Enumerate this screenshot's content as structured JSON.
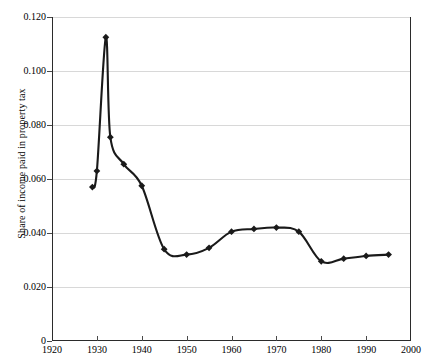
{
  "chart_data": {
    "type": "line",
    "title": "",
    "xlabel": "",
    "ylabel": "Share of income paid in property tax",
    "xlim": [
      1920,
      2000
    ],
    "ylim": [
      0,
      0.12
    ],
    "grid": true,
    "legend": "none",
    "marker": "diamond",
    "line_color": "#1a1a1a",
    "grid_color": "#d8d8d8",
    "axis_color": "#2b2b2b",
    "xticks": [
      1920,
      1930,
      1940,
      1950,
      1960,
      1970,
      1980,
      1990,
      2000
    ],
    "xtick_labels": [
      "1920",
      "1930",
      "1940",
      "1950",
      "1960",
      "1970",
      "1980",
      "1990",
      "2000"
    ],
    "yticks": [
      0,
      0.02,
      0.04,
      0.06,
      0.08,
      0.1,
      0.12
    ],
    "ytick_labels": [
      "0",
      "0.020",
      "0.040",
      "0.060",
      "0.080",
      "0.100",
      "0.120"
    ],
    "x": [
      1929,
      1930,
      1932,
      1933,
      1936,
      1940,
      1945,
      1950,
      1955,
      1960,
      1965,
      1970,
      1975,
      1980,
      1985,
      1990,
      1995
    ],
    "values": [
      0.057,
      0.063,
      0.1125,
      0.0755,
      0.0655,
      0.0575,
      0.034,
      0.032,
      0.0345,
      0.0405,
      0.0415,
      0.042,
      0.0405,
      0.0295,
      0.0305,
      0.0315,
      0.032
    ],
    "series": [
      {
        "name": "Share of income paid in property tax",
        "values": [
          0.057,
          0.063,
          0.1125,
          0.0755,
          0.0655,
          0.0575,
          0.034,
          0.032,
          0.0345,
          0.0405,
          0.0415,
          0.042,
          0.0405,
          0.0295,
          0.0305,
          0.0315,
          0.032
        ]
      }
    ]
  }
}
